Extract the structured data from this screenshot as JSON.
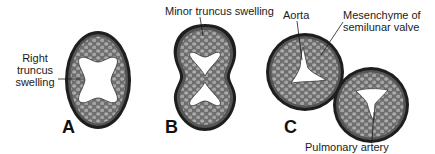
{
  "diagram": {
    "panels": [
      {
        "id": "A",
        "letter": "A",
        "shape": "oval",
        "lumen": "x-shaped"
      },
      {
        "id": "B",
        "letter": "B",
        "shape": "figure-eight",
        "lumen": "two triangular"
      },
      {
        "id": "C",
        "letter": "C",
        "shape": "two circles",
        "lumen": "three-cusp each"
      }
    ],
    "labels": {
      "right_truncus_line1": "Right",
      "right_truncus_line2": "truncus",
      "right_truncus_line3": "swelling",
      "minor_truncus": "Minor truncus swelling",
      "aorta": "Aorta",
      "mesenchyme_line1": "Mesenchyme of",
      "mesenchyme_line2": "semilunar valve",
      "pulmonary_artery": "Pulmonary artery"
    },
    "colors": {
      "wall_outer": "#1e1e1e",
      "mesenchyme_fill": "#7a7a7a",
      "cell_fill": "#a9a9a9",
      "lumen": "#ffffff",
      "text": "#1a1a1a"
    }
  }
}
